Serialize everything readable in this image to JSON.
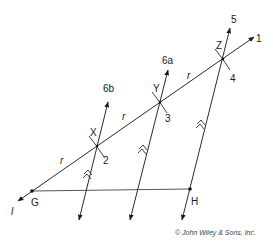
{
  "diagram": {
    "type": "geometric construction: dividing segment GH into equal parts using parallel lines",
    "points": {
      "G": {
        "label": "G",
        "x": 32,
        "y": 191
      },
      "H": {
        "label": "H",
        "x": 190,
        "y": 189
      },
      "X": {
        "label": "X",
        "x": 97,
        "y": 146
      },
      "Y": {
        "label": "Y",
        "x": 160,
        "y": 102
      },
      "Z": {
        "label": "Z",
        "x": 223,
        "y": 59
      }
    },
    "lines": {
      "l": {
        "label": "l",
        "step": "1"
      },
      "line_2": {
        "label": "2"
      },
      "line_3": {
        "label": "3"
      },
      "line_4": {
        "label": "4"
      },
      "line_5": {
        "label": "5"
      },
      "line_6a": {
        "label": "6a"
      },
      "line_6b": {
        "label": "6b"
      }
    },
    "step_labels": [
      "1",
      "2",
      "3",
      "4",
      "5",
      "6a",
      "6b"
    ],
    "segment_labels": [
      "r",
      "r",
      "r"
    ],
    "segment_label_text": "r",
    "parallel_mark": "double chevron",
    "copyright": "© John Wiley & Sons, Inc."
  }
}
